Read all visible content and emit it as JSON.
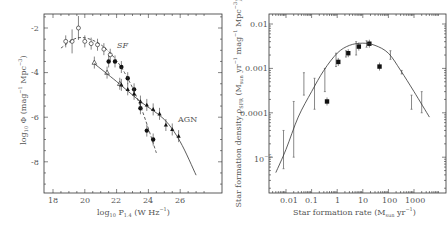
{
  "chart_data": [
    {
      "type": "scatter",
      "title": "",
      "xlabel": "log10 P1.4 (W Hz^-1)",
      "ylabel": "log10 Φ (mag^-1 Mpc^-3)",
      "xlim": [
        17.5,
        28
      ],
      "ylim": [
        -9.5,
        -1.5
      ],
      "xticks": [
        18,
        20,
        22,
        24,
        26
      ],
      "yticks": [
        -2,
        -4,
        -6,
        -8
      ],
      "grid": false,
      "annotations": [
        "SF",
        "AGN"
      ],
      "series": [
        {
          "name": "SF (open circles)",
          "marker": "open-circle",
          "x": [
            18.8,
            19.2,
            19.6,
            20.0,
            20.4,
            20.8,
            21.2,
            21.6
          ],
          "y": [
            -2.6,
            -2.6,
            -2.0,
            -2.6,
            -2.7,
            -2.75,
            -2.95,
            -3.2
          ]
        },
        {
          "name": "SF (filled)",
          "marker": "filled-circle",
          "x": [
            21.5,
            21.9,
            22.3,
            22.7,
            23.1,
            23.5,
            23.9,
            24.3
          ],
          "y": [
            -3.5,
            -3.5,
            -3.75,
            -4.25,
            -4.75,
            -5.6,
            -6.6,
            -7.0
          ]
        },
        {
          "name": "AGN (open triangles)",
          "marker": "open-triangle",
          "x": [
            20.6,
            21.4,
            22.2
          ],
          "y": [
            -3.55,
            -4.0,
            -4.5
          ]
        },
        {
          "name": "AGN (filled triangles)",
          "marker": "filled-triangle",
          "x": [
            22.3,
            22.7,
            23.1,
            23.5,
            23.9,
            24.3,
            24.7,
            25.1,
            25.5,
            25.9
          ],
          "y": [
            -4.55,
            -4.75,
            -4.95,
            -5.3,
            -5.45,
            -5.65,
            -5.85,
            -6.35,
            -6.55,
            -6.85
          ]
        },
        {
          "name": "SF fit (dashed)",
          "type": "line",
          "x": [
            18.5,
            19.5,
            20.5,
            21.5,
            22.5,
            23.5,
            24.5
          ],
          "y": [
            -2.9,
            -2.45,
            -2.55,
            -3.05,
            -4.0,
            -5.5,
            -7.6
          ]
        },
        {
          "name": "AGN fit (solid)",
          "type": "line",
          "x": [
            20.6,
            22,
            23.5,
            25,
            26,
            27
          ],
          "y": [
            -3.6,
            -4.4,
            -5.3,
            -6.1,
            -7.1,
            -8.6
          ]
        }
      ]
    },
    {
      "type": "scatter",
      "title": "",
      "xlabel": "Star formation rate (M_sun yr^-1)",
      "ylabel": "Star formation density ρ_SFR (M_sun yr^-1 mag^-1 Mpc^-3)",
      "xscale": "log",
      "yscale": "log",
      "xlim": [
        0.002,
        5000
      ],
      "ylim": [
        1.5e-06,
        0.015
      ],
      "xticks": [
        "0.01",
        "0.1",
        "1",
        "10",
        "100",
        "1000"
      ],
      "yticks": [
        "0.01",
        "0.001",
        "0.0001",
        "10^-5"
      ],
      "grid": false,
      "series": [
        {
          "name": "filled squares",
          "marker": "filled-square",
          "x": [
            0.4,
            1.1,
            2.7,
            7,
            18,
            45
          ],
          "y": [
            0.00018,
            0.0014,
            0.0022,
            0.0031,
            0.0036,
            0.0011
          ]
        },
        {
          "name": "error bars only",
          "x": [
            0.008,
            0.02,
            0.05,
            0.13,
            0.33,
            0.9,
            2.2,
            5.5,
            14,
            120,
            330,
            800,
            2000
          ],
          "y_low": [
            5.5e-06,
            1e-05,
            0.00025,
            0.00012,
            0.0003,
            0.0011,
            0.0018,
            0.002,
            0.003,
            0.0016,
            0.00075,
            0.00012,
            0.0001
          ],
          "y_high": [
            4e-05,
            0.00018,
            0.0008,
            0.0006,
            0.001,
            0.0022,
            0.0025,
            0.004,
            0.0042,
            0.0025,
            0.0009,
            0.00025,
            0.0003
          ]
        },
        {
          "name": "fit (solid)",
          "type": "line",
          "x": [
            0.004,
            0.01,
            0.03,
            0.1,
            0.3,
            1,
            3,
            10,
            30,
            100,
            300,
            1000,
            4000
          ],
          "y": [
            4.5e-06,
            1.5e-05,
            8e-05,
            0.0003,
            0.0009,
            0.0022,
            0.0033,
            0.0037,
            0.0033,
            0.0022,
            0.0009,
            0.0003,
            8e-05
          ]
        }
      ]
    }
  ],
  "left": {
    "ylabel_main": "log",
    "ylabel_sub": "10",
    "ylabel_rest": " Φ  (mag",
    "ylabel_exp1": "−1",
    "ylabel_rest2": " Mpc",
    "ylabel_exp2": "−3",
    "ylabel_close": ")",
    "xlabel_main": "log",
    "xlabel_sub": "10",
    "xlabel_p": " P",
    "xlabel_psub": "1.4",
    "xlabel_rest": " (W Hz",
    "xlabel_exp": "−1",
    "xlabel_close": ")",
    "ann_sf": "SF",
    "ann_agn": "AGN",
    "xticks": [
      "18",
      "20",
      "22",
      "24",
      "26"
    ],
    "yticks": [
      "-2",
      "-4",
      "-6",
      "-8"
    ]
  },
  "right": {
    "xlabel_a": "Star formation rate (M",
    "xlabel_sub": "sun",
    "xlabel_b": " yr",
    "xlabel_exp": "−1",
    "xlabel_c": ")",
    "ylabel_a": "Star formation density ρ",
    "ylabel_sub": "SFR",
    "ylabel_b": " (M",
    "ylabel_sub2": "sun",
    "ylabel_c": " yr",
    "ylabel_exp1": "−1",
    "ylabel_d": " mag",
    "ylabel_exp2": "−1",
    "ylabel_e": " Mpc",
    "ylabel_exp3": "−3",
    "ylabel_f": ")",
    "xticks": [
      "0.01",
      "0.1",
      "1",
      "10",
      "100",
      "1000"
    ],
    "yticks": [
      "0.01",
      "0.001",
      "0.0001",
      "10",
      "−5"
    ]
  }
}
